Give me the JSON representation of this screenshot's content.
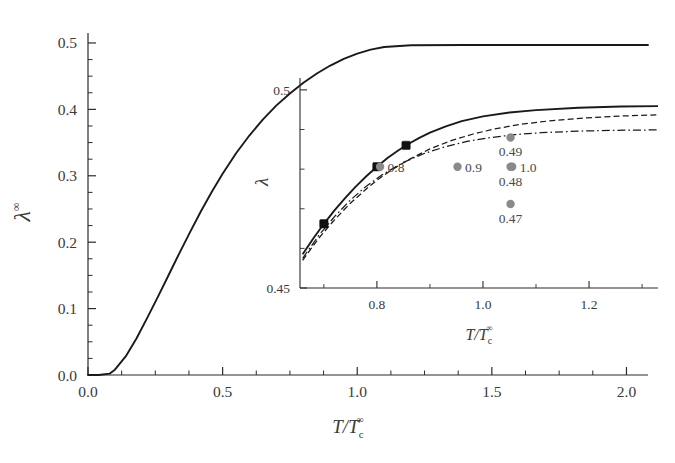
{
  "chart_data": {
    "type": "line",
    "title": "",
    "xlabel": "T/Tc^inf",
    "ylabel": "lambda^inf",
    "xlim": [
      0.0,
      2.08
    ],
    "ylim": [
      0.0,
      0.515
    ],
    "grid": false,
    "legend_position": "inset",
    "xticks": [
      "0.0",
      "0.5",
      "1.0",
      "1.5",
      "2.0"
    ],
    "xtick_values": [
      0.0,
      0.5,
      1.0,
      1.5,
      2.0
    ],
    "yticks": [
      "0.0",
      "0.1",
      "0.2",
      "0.3",
      "0.4",
      "0.5"
    ],
    "ytick_values": [
      0.0,
      0.1,
      0.2,
      0.3,
      0.4,
      0.5
    ],
    "minor_ticks_per_interval": 4,
    "series": [
      {
        "name": "lambda-infinity",
        "style": "solid",
        "color": "#1a1a1a",
        "x": [
          0.0,
          0.04,
          0.08,
          0.1,
          0.14,
          0.18,
          0.22,
          0.26,
          0.3,
          0.34,
          0.38,
          0.42,
          0.46,
          0.5,
          0.55,
          0.6,
          0.65,
          0.7,
          0.75,
          0.8,
          0.85,
          0.9,
          0.95,
          1.0,
          1.05,
          1.1,
          1.2,
          1.4,
          1.6,
          1.8,
          2.0,
          2.08
        ],
        "y": [
          0.0,
          0.0,
          0.002,
          0.008,
          0.028,
          0.055,
          0.086,
          0.118,
          0.151,
          0.184,
          0.216,
          0.247,
          0.276,
          0.303,
          0.334,
          0.361,
          0.385,
          0.406,
          0.424,
          0.44,
          0.454,
          0.466,
          0.476,
          0.484,
          0.49,
          0.494,
          0.4965,
          0.497,
          0.497,
          0.497,
          0.497,
          0.497
        ]
      }
    ],
    "inset": {
      "type": "line",
      "xlabel": "T/Tc^inf",
      "ylabel": "lambda",
      "xlim": [
        0.655,
        1.33
      ],
      "ylim": [
        0.45,
        0.503
      ],
      "xticks": [
        "0.8",
        "1.0",
        "1.2"
      ],
      "xtick_values": [
        0.8,
        1.0,
        1.2
      ],
      "yticks": [
        "0.45",
        "0.5"
      ],
      "ytick_values": [
        0.45,
        0.5
      ],
      "minor_ticks_per_interval": 4,
      "series": [
        {
          "name": "solid-curve",
          "style": "solid",
          "color": "#1a1a1a",
          "x": [
            0.66,
            0.68,
            0.7,
            0.72,
            0.74,
            0.76,
            0.78,
            0.8,
            0.82,
            0.84,
            0.86,
            0.88,
            0.9,
            0.93,
            0.96,
            1.0,
            1.05,
            1.1,
            1.18,
            1.26,
            1.33
          ],
          "y": [
            0.4585,
            0.4625,
            0.4662,
            0.4696,
            0.4727,
            0.4756,
            0.4782,
            0.4806,
            0.4828,
            0.4847,
            0.4864,
            0.4879,
            0.4892,
            0.4908,
            0.4921,
            0.4933,
            0.4943,
            0.4949,
            0.4955,
            0.4958,
            0.4959
          ]
        },
        {
          "name": "dashed-curve",
          "style": "dashed",
          "color": "#1a1a1a",
          "x": [
            0.66,
            0.69,
            0.72,
            0.75,
            0.78,
            0.8,
            0.83,
            0.86,
            0.9,
            0.94,
            0.98,
            1.02,
            1.07,
            1.12,
            1.19,
            1.26,
            1.33
          ],
          "y": [
            0.457,
            0.4625,
            0.4672,
            0.4714,
            0.475,
            0.4772,
            0.48,
            0.4824,
            0.4851,
            0.4872,
            0.4888,
            0.4901,
            0.4913,
            0.4921,
            0.4929,
            0.4934,
            0.4937
          ]
        },
        {
          "name": "dash-dot-curve",
          "style": "dashdot",
          "color": "#1a1a1a",
          "x": [
            0.66,
            0.69,
            0.72,
            0.75,
            0.78,
            0.81,
            0.85,
            0.89,
            0.93,
            0.97,
            1.01,
            1.06,
            1.11,
            1.18,
            1.25,
            1.33
          ],
          "y": [
            0.4575,
            0.4632,
            0.468,
            0.4722,
            0.4757,
            0.4786,
            0.4817,
            0.484,
            0.4857,
            0.487,
            0.4879,
            0.4887,
            0.4892,
            0.4896,
            0.4898,
            0.4899
          ]
        }
      ],
      "markers": [
        {
          "name": "marker-1",
          "x": 0.7,
          "y": 0.4662
        },
        {
          "name": "marker-2",
          "x": 0.8,
          "y": 0.4806
        },
        {
          "name": "marker-3",
          "x": 0.855,
          "y": 0.486
        }
      ],
      "legend_dots": [
        {
          "name": "dot-0.8",
          "label": "0.8",
          "x": 0.806,
          "y": 0.4806,
          "label_side": "right"
        },
        {
          "name": "dot-0.9",
          "label": "0.9",
          "x": 0.952,
          "y": 0.4806,
          "label_side": "right"
        },
        {
          "name": "dot-1.0",
          "label": "1.0",
          "x": 1.055,
          "y": 0.4806,
          "label_side": "right"
        },
        {
          "name": "dot-0.49",
          "label": "0.49",
          "x": 1.052,
          "y": 0.488,
          "label_side": "below"
        },
        {
          "name": "dot-0.48",
          "label": "0.48",
          "x": 1.052,
          "y": 0.4806,
          "label_side": "below"
        },
        {
          "name": "dot-0.47",
          "label": "0.47",
          "x": 1.052,
          "y": 0.4712,
          "label_side": "below"
        }
      ],
      "dot_color": "#8a8a8a"
    }
  },
  "labels": {
    "main_y_axis": "λ",
    "main_y_sup": "∞",
    "main_x_T": "T",
    "main_x_slash": "/",
    "main_x_Tc": "T",
    "main_x_sub": "c",
    "main_x_sup": "∞",
    "inset_y_axis": "λ",
    "inset_x_T": "T",
    "inset_x_slash": "/",
    "inset_x_Tc": "T",
    "inset_x_sub": "c",
    "inset_x_sup": "∞"
  }
}
